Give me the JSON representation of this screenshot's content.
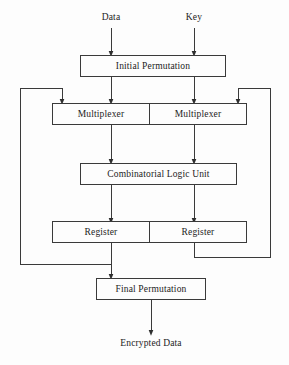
{
  "diagram": {
    "type": "flow-block-diagram",
    "colors": {
      "background": "#fdfdfd",
      "line": "#3a3a3a",
      "text": "#1c1c1c"
    },
    "inputs": [
      {
        "id": "data",
        "label": "Data"
      },
      {
        "id": "key",
        "label": "Key"
      }
    ],
    "outputs": [
      {
        "id": "encrypted-data",
        "label": "Encrypted Data"
      }
    ],
    "blocks": [
      {
        "id": "initial-permutation",
        "label": "Initial Permutation"
      },
      {
        "id": "multiplexer-left",
        "label": "Multiplexer"
      },
      {
        "id": "multiplexer-right",
        "label": "Multiplexer"
      },
      {
        "id": "combinatorial-logic-unit",
        "label": "Combinatorial Logic Unit"
      },
      {
        "id": "register-left",
        "label": "Register"
      },
      {
        "id": "register-right",
        "label": "Register"
      },
      {
        "id": "final-permutation",
        "label": "Final Permutation"
      }
    ],
    "connections": [
      {
        "from": "data",
        "to": "initial-permutation",
        "arrow": true
      },
      {
        "from": "key",
        "to": "initial-permutation",
        "arrow": true
      },
      {
        "from": "initial-permutation",
        "to": "multiplexer-left",
        "arrow": true
      },
      {
        "from": "initial-permutation",
        "to": "multiplexer-right",
        "arrow": true
      },
      {
        "from": "multiplexer-left",
        "to": "combinatorial-logic-unit",
        "arrow": true
      },
      {
        "from": "multiplexer-right",
        "to": "combinatorial-logic-unit",
        "arrow": true
      },
      {
        "from": "combinatorial-logic-unit",
        "to": "register-left",
        "arrow": true
      },
      {
        "from": "combinatorial-logic-unit",
        "to": "register-right",
        "arrow": true
      },
      {
        "from": "register-left",
        "to": "final-permutation",
        "arrow": true
      },
      {
        "from": "register-left",
        "to": "multiplexer-left",
        "arrow": true,
        "kind": "feedback-left"
      },
      {
        "from": "register-right",
        "to": "multiplexer-right",
        "arrow": true,
        "kind": "feedback-right"
      },
      {
        "from": "final-permutation",
        "to": "encrypted-data",
        "arrow": true
      }
    ]
  }
}
